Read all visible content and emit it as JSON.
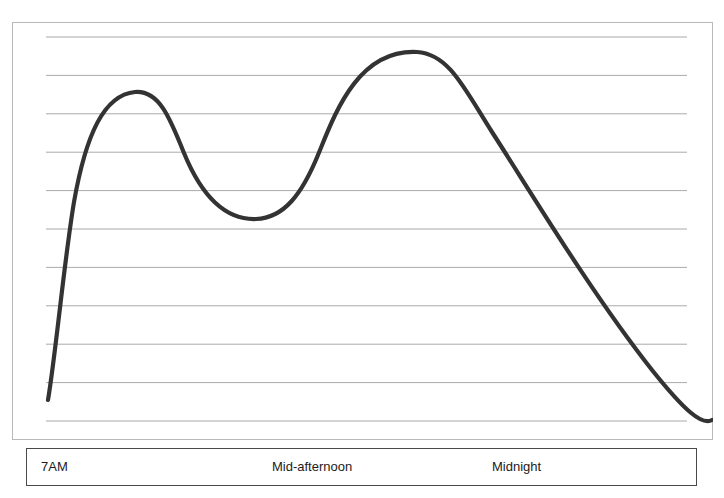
{
  "figure": {
    "y_axis_title": "Performance",
    "x_labels": {
      "start": "7AM",
      "middle": "Mid-afternoon",
      "end": "Midnight"
    },
    "colors": {
      "curve": "#333333",
      "gridline": "#aaaaaa",
      "frame": "#b9b9b9",
      "label_box_border": "#4a4a4a",
      "background": "#ffffff",
      "text": "#1b1b1b"
    }
  },
  "chart_data": {
    "type": "line",
    "title": "",
    "subtitle": "",
    "xlabel": "",
    "ylabel": "Performance",
    "grid": true,
    "legend": "none",
    "gridlines_count": 11,
    "xlim": [
      0,
      100
    ],
    "ylim": [
      0,
      100
    ],
    "x_tick_labels": [
      "7AM",
      "Mid-afternoon",
      "Midnight"
    ],
    "x_tick_positions": [
      2,
      33,
      66
    ],
    "y_tick_labels": [],
    "annotations": [],
    "series": [
      {
        "name": "Performance over the day",
        "x": [
          0,
          3,
          7,
          10,
          13,
          100
        ],
        "comment": "normalized 0-100 on both axes; y is percent of plot height from bottom",
        "points": [
          {
            "x": 0.3,
            "y": 9.6,
            "label": "start of day (7AM), low performance"
          },
          {
            "x": 5.0,
            "y": 30.0,
            "label": "rapid morning rise"
          },
          {
            "x": 9.3,
            "y": 57.0,
            "label": "steep climb"
          },
          {
            "x": 12.4,
            "y": 72.0,
            "label": "approaching morning peak"
          },
          {
            "x": 18.5,
            "y": 78.9,
            "label": "morning peak"
          },
          {
            "x": 26.0,
            "y": 74.0,
            "label": "post-peak decline"
          },
          {
            "x": 34.0,
            "y": 62.0,
            "label": "midday slide"
          },
          {
            "x": 40.0,
            "y": 52.0,
            "label": "continued decline"
          },
          {
            "x": 44.7,
            "y": 46.0,
            "label": "approaching afternoon dip"
          },
          {
            "x": 44.7,
            "y": 45.5,
            "label": "mid-afternoon trough"
          },
          {
            "x": 50.5,
            "y": 50.0,
            "label": "recovery begins"
          },
          {
            "x": 54.0,
            "y": 64.0,
            "label": "sharp evening rise"
          },
          {
            "x": 57.8,
            "y": 88.0,
            "label": "approaching evening peak"
          },
          {
            "x": 57.8,
            "y": 88.9,
            "label": "evening peak"
          },
          {
            "x": 66.0,
            "y": 76.0,
            "label": "evening decline starts"
          },
          {
            "x": 75.0,
            "y": 58.0,
            "label": "steady decline"
          },
          {
            "x": 85.0,
            "y": 38.0,
            "label": "late night decline"
          },
          {
            "x": 95.0,
            "y": 18.0,
            "label": "approaching end"
          },
          {
            "x": 100.0,
            "y": 4.8,
            "label": "end of day, lowest performance"
          }
        ],
        "path_d": "M 36,378 C 44,330 52,240 62,180 C 74,112 92,73 123,70 C 147,68 158,96 172,131 C 190,175 214,198 244,197 C 272,196 290,172 306,133 C 322,94 345,27 405,30 C 437,32 452,66 480,110 C 520,172 580,272 640,348 C 672,388 690,404 700,398"
      }
    ]
  }
}
